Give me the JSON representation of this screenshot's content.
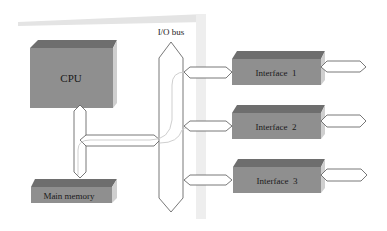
{
  "diagram": {
    "bus_label": "I/O bus",
    "cpu_label": "CPU",
    "memory_label": "Main memory",
    "interfaces": [
      {
        "label": "Interface  1"
      },
      {
        "label": "Interface  2"
      },
      {
        "label": "Interface  3"
      }
    ],
    "colors": {
      "box_front": "#8f8f8f",
      "box_top": "#6e6e6e",
      "box_side": "#c9c9c9",
      "backdrop": "#efefef",
      "arrow_stroke": "#555555"
    }
  }
}
